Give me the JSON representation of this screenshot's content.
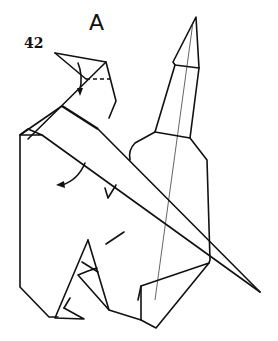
{
  "diagram": {
    "type": "origami-folding-step",
    "step_number": "42",
    "view_label": "A",
    "colors": {
      "line": "#111111",
      "background": "#ffffff"
    },
    "annotations": [
      {
        "kind": "valley-fold-dashed-line",
        "location": "head"
      },
      {
        "kind": "fold-arrow",
        "location": "head",
        "direction": "down"
      },
      {
        "kind": "fold-arrow",
        "location": "body-left",
        "direction": "down-left"
      }
    ]
  }
}
